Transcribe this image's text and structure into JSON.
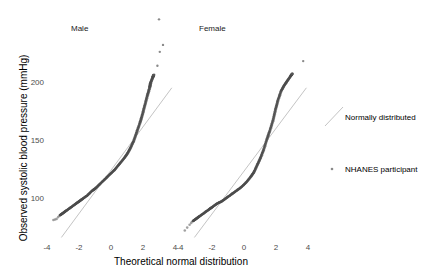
{
  "chart_data": {
    "type": "scatter",
    "subtype": "qq-plot",
    "xlabel": "Theoretical normal distribution",
    "ylabel": "Observed systolic blood pressure (mmHg)",
    "grid": false,
    "legend_position": "right",
    "legend": [
      {
        "label": "Normally distributed",
        "kind": "line",
        "color": "#bfbfbf"
      },
      {
        "label": "NHANES participant",
        "kind": "point",
        "color": "#555555"
      }
    ],
    "y_ticks": [
      100,
      150,
      200
    ],
    "ylim": [
      62,
      246
    ],
    "panels": [
      {
        "title": "Male",
        "x_ticks": [
          -4,
          -2,
          0,
          2,
          4
        ],
        "xlim": [
          -4.4,
          4.4
        ],
        "reference_line": {
          "x": [
            -3.1,
            3.8
          ],
          "y": [
            66,
            195
          ]
        },
        "points_curve": [
          [
            -3.6,
            81
          ],
          [
            -3.4,
            82
          ],
          [
            -3.2,
            85
          ],
          [
            -3.0,
            87
          ],
          [
            -2.8,
            89
          ],
          [
            -2.5,
            92
          ],
          [
            -2.2,
            95
          ],
          [
            -2.0,
            97
          ],
          [
            -1.8,
            99
          ],
          [
            -1.5,
            102
          ],
          [
            -1.2,
            106
          ],
          [
            -1.0,
            108
          ],
          [
            -0.7,
            112
          ],
          [
            -0.4,
            116
          ],
          [
            -0.1,
            120
          ],
          [
            0.2,
            124
          ],
          [
            0.5,
            129
          ],
          [
            0.8,
            134
          ],
          [
            1.0,
            138
          ],
          [
            1.2,
            143
          ],
          [
            1.4,
            149
          ],
          [
            1.6,
            157
          ],
          [
            1.8,
            165
          ],
          [
            1.95,
            172
          ],
          [
            2.1,
            180
          ],
          [
            2.25,
            188
          ],
          [
            2.4,
            195
          ],
          [
            2.45,
            199
          ],
          [
            2.6,
            204
          ],
          [
            2.65,
            206
          ]
        ],
        "outliers": [
          [
            2.9,
            214
          ],
          [
            3.05,
            226
          ],
          [
            3.25,
            232
          ],
          [
            3.0,
            254
          ]
        ]
      },
      {
        "title": "Female",
        "x_ticks": [
          -4,
          -2,
          0,
          2,
          4
        ],
        "xlim": [
          -4.4,
          4.4
        ],
        "reference_line": {
          "x": [
            -3.1,
            3.9
          ],
          "y": [
            66,
            195
          ]
        },
        "points_curve": [
          [
            -3.7,
            72
          ],
          [
            -3.4,
            77
          ],
          [
            -3.2,
            80
          ],
          [
            -3.0,
            82
          ],
          [
            -2.8,
            84
          ],
          [
            -2.5,
            87
          ],
          [
            -2.2,
            90
          ],
          [
            -2.0,
            92
          ],
          [
            -1.7,
            95
          ],
          [
            -1.4,
            97
          ],
          [
            -1.1,
            100
          ],
          [
            -0.8,
            103
          ],
          [
            -0.5,
            106
          ],
          [
            -0.2,
            109
          ],
          [
            0.1,
            113
          ],
          [
            0.4,
            118
          ],
          [
            0.6,
            122
          ],
          [
            0.8,
            128
          ],
          [
            1.0,
            134
          ],
          [
            1.2,
            141
          ],
          [
            1.4,
            150
          ],
          [
            1.6,
            158
          ],
          [
            1.8,
            167
          ],
          [
            1.95,
            176
          ],
          [
            2.1,
            184
          ],
          [
            2.3,
            192
          ],
          [
            2.5,
            197
          ],
          [
            2.7,
            201
          ],
          [
            2.9,
            205
          ],
          [
            3.0,
            207
          ]
        ],
        "outliers": [
          [
            3.7,
            218
          ]
        ]
      }
    ]
  }
}
